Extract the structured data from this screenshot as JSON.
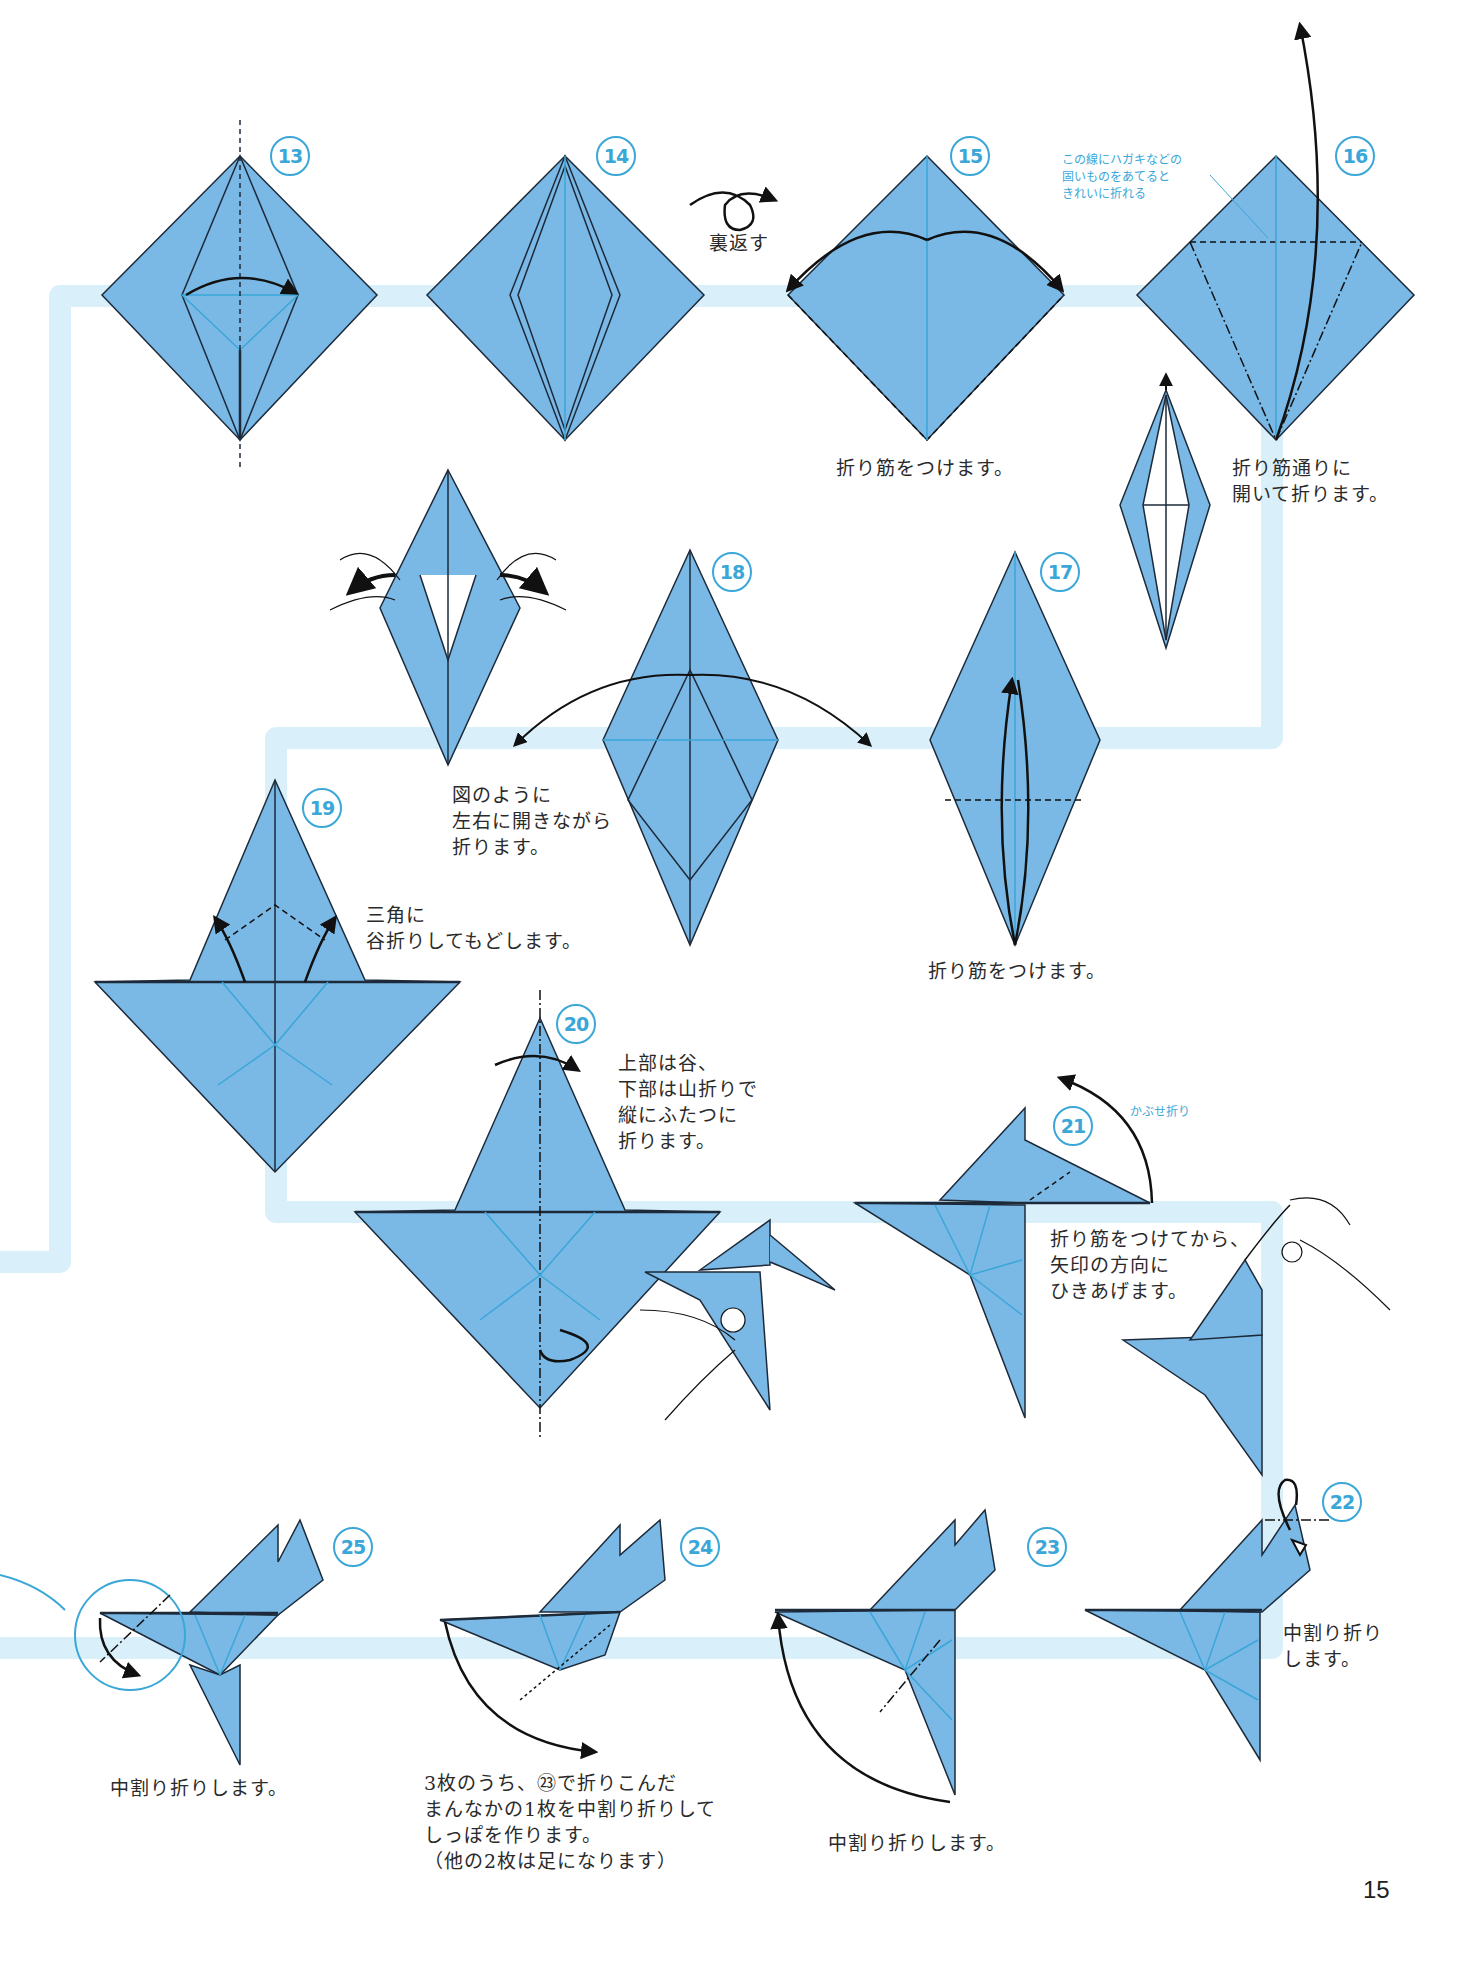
{
  "page": {
    "number": "15",
    "colors": {
      "paper": "#7ab8e6",
      "paper_edge": "#1d2a3a",
      "crease": "#3aa7d8",
      "flow_band": "#d9f0fa",
      "step_circle": "#3aa7d8",
      "note_text": "#3aa7d8"
    }
  },
  "steps": [
    {
      "id": "13",
      "label": "13"
    },
    {
      "id": "14",
      "label": "14"
    },
    {
      "id": "15",
      "label": "15",
      "caption": "折り筋をつけます。"
    },
    {
      "id": "16",
      "label": "16",
      "caption": "折り筋通りに\n開いて折ります。",
      "note": "この線にハガキなどの\n固いものをあてると\nきれいに折れる"
    },
    {
      "id": "17",
      "label": "17",
      "caption": "折り筋をつけます。"
    },
    {
      "id": "18",
      "label": "18",
      "caption": "図のように\n左右に開きながら\n折ります。"
    },
    {
      "id": "19",
      "label": "19",
      "caption": "三角に\n谷折りしてもどします。"
    },
    {
      "id": "20",
      "label": "20",
      "caption": "上部は谷、\n下部は山折りで\n縦にふたつに\n折ります。"
    },
    {
      "id": "21",
      "label": "21",
      "caption": "折り筋をつけてから、\n矢印の方向に\nひきあげます。",
      "note": "かぶせ折り"
    },
    {
      "id": "22",
      "label": "22",
      "caption": "中割り折り\nします。"
    },
    {
      "id": "23",
      "label": "23",
      "caption": "中割り折りします。"
    },
    {
      "id": "24",
      "label": "24",
      "caption": "3枚のうち、㉓で折りこんだ\nまんなかの1枚を中割り折りして\nしっぽを作ります。\n（他の2枚は足になります）"
    },
    {
      "id": "25",
      "label": "25",
      "caption": "中割り折りします。"
    }
  ],
  "labels": {
    "turn_over": "裏返す"
  }
}
